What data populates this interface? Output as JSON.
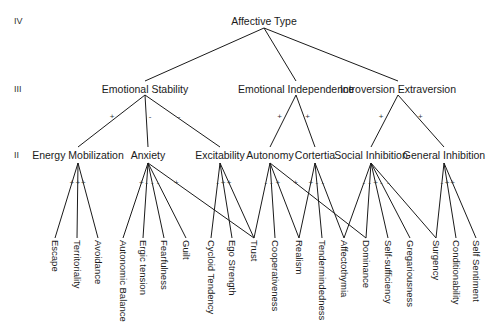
{
  "levels": [
    {
      "label": "IV",
      "y": 21
    },
    {
      "label": "III",
      "y": 89
    },
    {
      "label": "II",
      "y": 155
    }
  ],
  "root": {
    "id": "affective_type",
    "label": "Affective Type",
    "x": 264,
    "y": 21,
    "anchor_y": 28
  },
  "level3": [
    {
      "id": "emotional_stability",
      "label": "Emotional Stability",
      "x": 145,
      "y": 89,
      "sign": "",
      "anchor_top": 81,
      "anchor_bottom": 95
    },
    {
      "id": "emotional_independence",
      "label": "Emotional Independence",
      "x": 296,
      "y": 89,
      "anchor_top": 81,
      "anchor_bottom": 95
    },
    {
      "id": "introversion_extraversion",
      "label": "Introversion Extraversion",
      "x": 398,
      "y": 89,
      "anchor_top": 81,
      "anchor_bottom": 95
    }
  ],
  "level2": [
    {
      "id": "energy_mobilization",
      "label": "Energy Mobilization",
      "x": 78,
      "y": 155,
      "parent": "emotional_stability",
      "sign": "+"
    },
    {
      "id": "anxiety",
      "label": "Anxiety",
      "x": 148,
      "y": 155,
      "parent": "emotional_stability",
      "sign": "-"
    },
    {
      "id": "excitability",
      "label": "Excitability",
      "x": 220,
      "y": 155,
      "parent": "emotional_stability",
      "sign": "-"
    },
    {
      "id": "autonomy",
      "label": "Autonomy",
      "x": 270,
      "y": 155,
      "parent": "emotional_independence",
      "sign": "+"
    },
    {
      "id": "cortertia",
      "label": "Cortertia",
      "x": 315,
      "y": 155,
      "parent": "emotional_independence",
      "sign": "+"
    },
    {
      "id": "social_inhibition",
      "label": "Social Inhibition",
      "x": 371,
      "y": 155,
      "parent": "introversion_extraversion",
      "sign": "+"
    },
    {
      "id": "general_inhibition",
      "label": "General Inhibition",
      "x": 444,
      "y": 155,
      "parent": "introversion_extraversion",
      "sign": "+"
    }
  ],
  "leaves": [
    {
      "id": "escape",
      "label": "Escape",
      "x": 55
    },
    {
      "id": "territoriality",
      "label": "Territoriality",
      "x": 77
    },
    {
      "id": "avoidance",
      "label": "Avoidance",
      "x": 98
    },
    {
      "id": "autonomic_balance",
      "label": "Autonomic Balance",
      "x": 123
    },
    {
      "id": "ergic_tension",
      "label": "Ergic tension",
      "x": 143
    },
    {
      "id": "fearfulness",
      "label": "Fearfulness",
      "x": 164
    },
    {
      "id": "guilt",
      "label": "Guilt",
      "x": 186
    },
    {
      "id": "cycloid_tendency",
      "label": "Cycloid Tendency",
      "x": 211
    },
    {
      "id": "ego_strength",
      "label": "Ego Strength",
      "x": 232
    },
    {
      "id": "trust",
      "label": "Trust",
      "x": 254
    },
    {
      "id": "cooperativeness",
      "label": "Cooperativeness",
      "x": 275
    },
    {
      "id": "realism",
      "label": "Realism",
      "x": 299
    },
    {
      "id": "tendermindedness",
      "label": "Tendermindedness",
      "x": 322
    },
    {
      "id": "affectothymia",
      "label": "Affectothymia",
      "x": 344
    },
    {
      "id": "dominance",
      "label": "Dominance",
      "x": 366
    },
    {
      "id": "self_sufficiency",
      "label": "Self-sufficiency",
      "x": 388
    },
    {
      "id": "gregariousness",
      "label": "Gregariousness",
      "x": 410
    },
    {
      "id": "surgency",
      "label": "Surgency",
      "x": 436
    },
    {
      "id": "conditionability",
      "label": "Conditionability",
      "x": 456
    },
    {
      "id": "self_sentiment",
      "label": "Self Sentiment",
      "x": 476
    }
  ],
  "leaf_edges": [
    {
      "parent": "energy_mobilization",
      "leaf": "escape",
      "sign": "+"
    },
    {
      "parent": "energy_mobilization",
      "leaf": "territoriality",
      "sign": "+"
    },
    {
      "parent": "energy_mobilization",
      "leaf": "avoidance",
      "sign": "+"
    },
    {
      "parent": "anxiety",
      "leaf": "autonomic_balance",
      "sign": "+"
    },
    {
      "parent": "anxiety",
      "leaf": "ergic_tension",
      "sign": "-"
    },
    {
      "parent": "anxiety",
      "leaf": "fearfulness",
      "sign": "-"
    },
    {
      "parent": "anxiety",
      "leaf": "guilt",
      "sign": "-"
    },
    {
      "parent": "anxiety",
      "leaf": "trust",
      "sign": "+"
    },
    {
      "parent": "excitability",
      "leaf": "cycloid_tendency",
      "sign": "-"
    },
    {
      "parent": "excitability",
      "leaf": "ego_strength",
      "sign": "+"
    },
    {
      "parent": "excitability",
      "leaf": "trust",
      "sign": "+"
    },
    {
      "parent": "autonomy",
      "leaf": "trust",
      "sign": "-"
    },
    {
      "parent": "autonomy",
      "leaf": "cooperativeness",
      "sign": "-"
    },
    {
      "parent": "autonomy",
      "leaf": "realism",
      "sign": "+"
    },
    {
      "parent": "autonomy",
      "leaf": "dominance",
      "sign": "+"
    },
    {
      "parent": "cortertia",
      "leaf": "realism",
      "sign": "+"
    },
    {
      "parent": "cortertia",
      "leaf": "tendermindedness",
      "sign": "-"
    },
    {
      "parent": "cortertia",
      "leaf": "affectothymia",
      "sign": "-"
    },
    {
      "parent": "social_inhibition",
      "leaf": "affectothymia",
      "sign": "-"
    },
    {
      "parent": "social_inhibition",
      "leaf": "dominance",
      "sign": "-"
    },
    {
      "parent": "social_inhibition",
      "leaf": "self_sufficiency",
      "sign": "+"
    },
    {
      "parent": "social_inhibition",
      "leaf": "gregariousness",
      "sign": "-"
    },
    {
      "parent": "social_inhibition",
      "leaf": "surgency",
      "sign": "-"
    },
    {
      "parent": "general_inhibition",
      "leaf": "surgency",
      "sign": "-"
    },
    {
      "parent": "general_inhibition",
      "leaf": "conditionability",
      "sign": "+"
    },
    {
      "parent": "general_inhibition",
      "leaf": "self_sentiment",
      "sign": "+"
    }
  ],
  "colors": {
    "ink": "#1a1a1a",
    "background": "#ffffff"
  }
}
